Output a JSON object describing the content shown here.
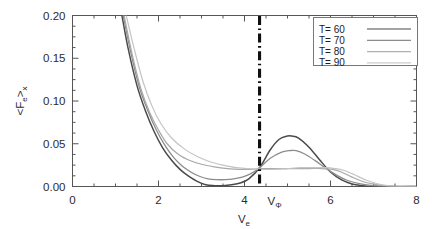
{
  "chart_data": {
    "type": "line",
    "title": "",
    "subtitle": "",
    "xlabel": "V_e",
    "xlabel_base": "V",
    "xlabel_sub": "e",
    "ylabel": "<F_e>_x",
    "ylabel_parts": {
      "open": "<F",
      "sub1": "e",
      "close": ">",
      "sub2": "x"
    },
    "xlim": [
      0,
      8
    ],
    "ylim": [
      0.0,
      0.2
    ],
    "xticks": [
      0,
      2,
      4,
      6,
      8
    ],
    "xtick_labels": [
      "0",
      "2",
      "4",
      "6",
      "8"
    ],
    "yticks": [
      0.0,
      0.05,
      0.1,
      0.15,
      0.2
    ],
    "ytick_labels": [
      "0.00",
      "0.05",
      "0.10",
      "0.15",
      "0.20"
    ],
    "minor_tick_step_x": 0.5,
    "minor_tick_step_y": 0.0125,
    "grid": false,
    "legend_position": "upper-right",
    "annotations": [
      {
        "name": "phase-velocity-marker",
        "label": "V_Φ",
        "label_base": "V",
        "label_sub": "Φ",
        "x": 4.35,
        "style": "dash-dot vertical line",
        "color": "#101010"
      }
    ],
    "series": [
      {
        "name": "T= 60",
        "label": "T= 60",
        "temperature": 60,
        "color": "#4a4a4a",
        "width": 1.5,
        "x": [
          1.15,
          1.3,
          1.5,
          1.7,
          1.9,
          2.1,
          2.3,
          2.5,
          2.7,
          2.9,
          3.1,
          3.3,
          3.5,
          3.7,
          3.9,
          4.1,
          4.35,
          4.6,
          4.8,
          5.0,
          5.1,
          5.25,
          5.5,
          5.75,
          6.0,
          6.25,
          6.5,
          6.75,
          7.0,
          7.4,
          8.0
        ],
        "y": [
          0.2,
          0.16,
          0.118,
          0.088,
          0.064,
          0.045,
          0.031,
          0.02,
          0.012,
          0.006,
          0.002,
          0.001,
          0.001,
          0.002,
          0.004,
          0.009,
          0.022,
          0.043,
          0.055,
          0.059,
          0.059,
          0.057,
          0.046,
          0.031,
          0.017,
          0.008,
          0.003,
          0.001,
          0.0,
          0.0,
          0.0
        ]
      },
      {
        "name": "T= 70",
        "label": "T= 70",
        "temperature": 70,
        "color": "#8c8c8c",
        "width": 1.3,
        "x": [
          1.18,
          1.35,
          1.55,
          1.75,
          1.95,
          2.15,
          2.35,
          2.55,
          2.75,
          2.95,
          3.15,
          3.35,
          3.55,
          3.75,
          3.95,
          4.15,
          4.35,
          4.6,
          4.85,
          5.05,
          5.2,
          5.4,
          5.65,
          5.9,
          6.15,
          6.4,
          6.7,
          7.0,
          7.4,
          8.0
        ],
        "y": [
          0.2,
          0.158,
          0.117,
          0.089,
          0.066,
          0.048,
          0.034,
          0.024,
          0.017,
          0.012,
          0.009,
          0.008,
          0.008,
          0.009,
          0.011,
          0.015,
          0.022,
          0.033,
          0.04,
          0.042,
          0.042,
          0.038,
          0.03,
          0.021,
          0.013,
          0.007,
          0.003,
          0.001,
          0.0,
          0.0
        ]
      },
      {
        "name": "T= 80",
        "label": "T= 80",
        "temperature": 80,
        "color": "#a8a8a8",
        "width": 1.2,
        "x": [
          1.2,
          1.4,
          1.6,
          1.8,
          2.0,
          2.2,
          2.45,
          2.7,
          3.0,
          3.3,
          3.6,
          3.9,
          4.15,
          4.35,
          4.6,
          4.9,
          5.2,
          5.5,
          5.8,
          6.05,
          6.25,
          6.5,
          6.8,
          7.1,
          7.5,
          8.0
        ],
        "y": [
          0.2,
          0.152,
          0.113,
          0.086,
          0.066,
          0.05,
          0.038,
          0.031,
          0.026,
          0.023,
          0.021,
          0.02,
          0.02,
          0.021,
          0.021,
          0.021,
          0.021,
          0.021,
          0.021,
          0.02,
          0.017,
          0.011,
          0.005,
          0.002,
          0.0,
          0.0
        ]
      },
      {
        "name": "T= 90",
        "label": "T= 90",
        "temperature": 90,
        "color": "#c4c4c4",
        "width": 1.2,
        "x": [
          1.25,
          1.45,
          1.65,
          1.85,
          2.05,
          2.3,
          2.6,
          2.9,
          3.2,
          3.5,
          3.8,
          4.1,
          4.35,
          4.7,
          5.0,
          5.3,
          5.6,
          5.9,
          6.1,
          6.3,
          6.55,
          6.85,
          7.2,
          7.6,
          8.0
        ],
        "y": [
          0.2,
          0.158,
          0.121,
          0.094,
          0.074,
          0.057,
          0.044,
          0.035,
          0.029,
          0.025,
          0.022,
          0.021,
          0.02,
          0.02,
          0.021,
          0.022,
          0.022,
          0.022,
          0.021,
          0.019,
          0.014,
          0.007,
          0.002,
          0.0,
          0.0
        ]
      }
    ]
  },
  "legend": {
    "entries": [
      {
        "label": "T= 60",
        "color": "#4a4a4a"
      },
      {
        "label": "T= 70",
        "color": "#8c8c8c"
      },
      {
        "label": "T= 80",
        "color": "#b0b0b0"
      },
      {
        "label": "T= 90",
        "color": "#cccccc"
      }
    ]
  }
}
